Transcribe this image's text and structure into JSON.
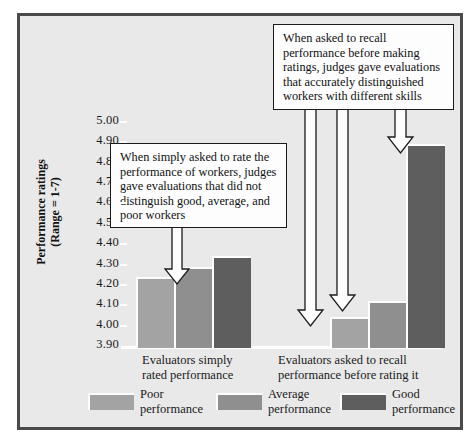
{
  "chart_data": {
    "type": "bar",
    "title": "",
    "subtitle": "",
    "xlabel": "",
    "ylabel": "Performance ratings",
    "ylabel_sub": "(Range = 1-7)",
    "ylim": [
      3.9,
      5.0
    ],
    "ytick_labels": [
      "5.00",
      "4.90",
      "4.80",
      "4.70",
      "4.60",
      "4.50",
      "4.40",
      "4.30",
      "4.20",
      "4.10",
      "4.00",
      "3.90"
    ],
    "ytick_values": [
      5.0,
      4.9,
      4.8,
      4.7,
      4.6,
      4.5,
      4.4,
      4.3,
      4.2,
      4.1,
      4.0,
      3.9
    ],
    "grid": false,
    "legend_position": "bottom",
    "categories": [
      "Evaluators simply rated performance",
      "Evaluators asked to recall performance before rating it"
    ],
    "series": [
      {
        "name": "Poor performance",
        "color": "#a3a3a3",
        "values": [
          4.24,
          4.04
        ]
      },
      {
        "name": "Average performance",
        "color": "#8f8f8f",
        "values": [
          4.29,
          4.12
        ]
      },
      {
        "name": "Good performance",
        "color": "#5e5e5e",
        "values": [
          4.34,
          4.89
        ]
      }
    ],
    "annotations": [
      "When simply asked to rate the performance of workers, judges gave evaluations that did not distinguish good, average, and poor workers",
      "When asked to recall performance before making ratings, judges gave evaluations that accurately distinguished workers with different skills"
    ]
  },
  "axis": {
    "y_title_line1": "Performance ratings",
    "y_title_line2": "(Range = 1-7)",
    "ticks": [
      "5.00",
      "4.90",
      "4.80",
      "4.70",
      "4.60",
      "4.50",
      "4.40",
      "4.30",
      "4.20",
      "4.10",
      "4.00",
      "3.90"
    ]
  },
  "groups": [
    {
      "line1": "Evaluators simply",
      "line2": "rated performance"
    },
    {
      "line1": "Evaluators asked to recall",
      "line2": "performance before rating it"
    }
  ],
  "callouts": {
    "left": "When simply asked to rate the performance of workers, judges gave evaluations that did not distinguish good, average, and poor workers",
    "right": "When asked to recall performance before making ratings, judges gave evaluations that accurately distinguished workers with different skills"
  },
  "legend": [
    {
      "line1": "Poor",
      "line2": "performance",
      "color": "#a3a3a3"
    },
    {
      "line1": "Average",
      "line2": "performance",
      "color": "#8f8f8f"
    },
    {
      "line1": "Good",
      "line2": "performance",
      "color": "#5e5e5e"
    }
  ]
}
